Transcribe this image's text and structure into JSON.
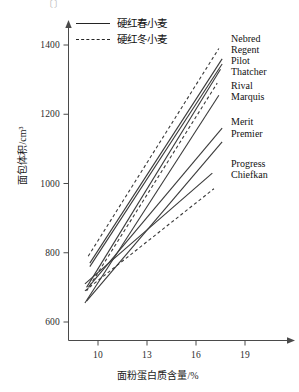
{
  "figure": {
    "top_cut_text": "〔〕",
    "legend": [
      {
        "label": "硬红春小麦",
        "style": "solid",
        "swatch_name": "legend-swatch-solid"
      },
      {
        "label": "硬红冬小麦",
        "style": "dashed",
        "swatch_name": "legend-swatch-dashed"
      }
    ]
  },
  "chart_data": {
    "type": "line",
    "title": "",
    "xlabel": "面粉蛋白质含量/%",
    "ylabel": "面包体积/cm³",
    "xlim": [
      8.5,
      20.2
    ],
    "ylim": [
      520,
      1460
    ],
    "xticks": [
      10,
      13,
      16,
      19
    ],
    "xtick_labels": [
      "10",
      "13",
      "16",
      "19"
    ],
    "yticks": [
      600,
      800,
      1000,
      1200,
      1400
    ],
    "ytick_labels": [
      "600",
      "800",
      "1000",
      "1200",
      "1400"
    ],
    "grid": false,
    "legend_position": "top-left-inside",
    "legend_entries": [
      "硬红春小麦",
      "硬红冬小麦"
    ],
    "annotations": [
      "Nebred",
      "Regent",
      "Pilot",
      "Thatcher",
      "Rival",
      "Marquis",
      "Merit",
      "Premier",
      "Progress",
      "Chiefkan"
    ],
    "series": [
      {
        "name": "Nebred",
        "style": "dashed",
        "x": [
          9.4,
          17.4
        ],
        "y": [
          790,
          1390
        ]
      },
      {
        "name": "Regent",
        "style": "solid",
        "x": [
          9.5,
          17.6
        ],
        "y": [
          770,
          1360
        ]
      },
      {
        "name": "Pilot",
        "style": "solid",
        "x": [
          9.5,
          17.6
        ],
        "y": [
          760,
          1345
        ]
      },
      {
        "name": "Thatcher",
        "style": "solid",
        "x": [
          9.3,
          17.5
        ],
        "y": [
          700,
          1330
        ]
      },
      {
        "name": "Rival",
        "style": "dashed",
        "x": [
          9.3,
          17.3
        ],
        "y": [
          690,
          1290
        ]
      },
      {
        "name": "Marquis",
        "style": "solid",
        "x": [
          9.2,
          17.4
        ],
        "y": [
          655,
          1255
        ]
      },
      {
        "name": "Merit",
        "style": "solid",
        "x": [
          9.4,
          17.6
        ],
        "y": [
          700,
          1160
        ]
      },
      {
        "name": "Premier",
        "style": "solid",
        "x": [
          9.3,
          17.6
        ],
        "y": [
          660,
          1120
        ]
      },
      {
        "name": "Progress",
        "style": "solid",
        "x": [
          9.2,
          17.0
        ],
        "y": [
          710,
          1030
        ]
      },
      {
        "name": "Chiefkan",
        "style": "dashed",
        "x": [
          9.2,
          17.1
        ],
        "y": [
          690,
          985
        ]
      }
    ],
    "series_label_positions": [
      {
        "name": "Nebred",
        "top": 0
      },
      {
        "name": "Regent",
        "top": 11
      },
      {
        "name": "Pilot",
        "top": 22
      },
      {
        "name": "Thatcher",
        "top": 33
      },
      {
        "name": "Rival",
        "top": 47
      },
      {
        "name": "Marquis",
        "top": 58
      },
      {
        "name": "Merit",
        "top": 83
      },
      {
        "name": "Premier",
        "top": 95
      },
      {
        "name": "Progress",
        "top": 125
      },
      {
        "name": "Chiefkan",
        "top": 136
      }
    ],
    "colors": {
      "line": "#3a3a3a",
      "axis": "#4a4a4a",
      "text": "#121212",
      "background": "#ffffff"
    }
  }
}
